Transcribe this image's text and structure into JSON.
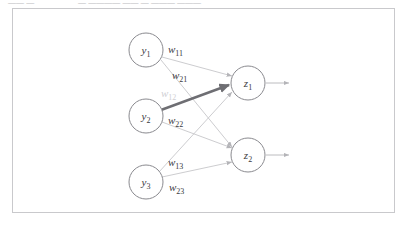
{
  "top_strip": {
    "segment_a": "——  —",
    "segment_b": "— ———— —— — ——— ———"
  },
  "figure": {
    "title": "",
    "border_color": "#c9c9cc",
    "background": "#ffffff"
  },
  "diagram": {
    "type": "neural-network",
    "colors": {
      "node_stroke": "#8a8a8f",
      "edge": "#c6c6ca",
      "edge_highlight": "#6e6e73",
      "label": "#3a3a3e",
      "label_faded": "#cfcfd3"
    },
    "input_nodes": [
      {
        "id": "y1",
        "base": "y",
        "sub": "1",
        "cx": 146,
        "cy": 50,
        "r": 17
      },
      {
        "id": "y2",
        "base": "y",
        "sub": "2",
        "cx": 146,
        "cy": 116,
        "r": 17
      },
      {
        "id": "y3",
        "base": "y",
        "sub": "3",
        "cx": 146,
        "cy": 182,
        "r": 17
      }
    ],
    "output_nodes": [
      {
        "id": "z1",
        "base": "z",
        "sub": "1",
        "cx": 248,
        "cy": 83,
        "r": 17
      },
      {
        "id": "z2",
        "base": "z",
        "sub": "2",
        "cx": 248,
        "cy": 155,
        "r": 17
      }
    ],
    "weights": [
      {
        "id": "w11",
        "base": "w",
        "sub": "11",
        "from": "y1",
        "to": "z1",
        "x": 168,
        "y": 53,
        "faded": false,
        "highlight": false
      },
      {
        "id": "w21",
        "base": "w",
        "sub": "21",
        "from": "y1",
        "to": "z2",
        "x": 172,
        "y": 79,
        "faded": false,
        "highlight": false
      },
      {
        "id": "w12",
        "base": "w",
        "sub": "12",
        "from": "y2",
        "to": "z1",
        "x": 161,
        "y": 97,
        "faded": true,
        "highlight": true
      },
      {
        "id": "w22",
        "base": "w",
        "sub": "22",
        "from": "y2",
        "to": "z2",
        "x": 168,
        "y": 124,
        "faded": false,
        "highlight": false
      },
      {
        "id": "w13",
        "base": "w",
        "sub": "13",
        "from": "y3",
        "to": "z1",
        "x": 168,
        "y": 166,
        "faded": false,
        "highlight": false
      },
      {
        "id": "w23",
        "base": "w",
        "sub": "23",
        "from": "y3",
        "to": "z2",
        "x": 169,
        "y": 191,
        "faded": false,
        "highlight": false
      }
    ],
    "outputs": [
      {
        "id": "out1",
        "from": "z1",
        "x1": 266,
        "y1": 83,
        "x2": 291,
        "y2": 83
      },
      {
        "id": "out2",
        "from": "z2",
        "x1": 266,
        "y1": 155,
        "x2": 291,
        "y2": 155
      }
    ]
  }
}
